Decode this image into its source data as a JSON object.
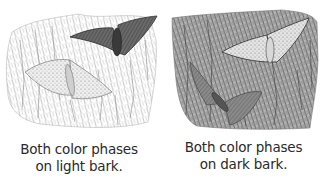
{
  "figure": {
    "panels": [
      {
        "id": "light-bark",
        "bark_shade": "light",
        "moths": [
          "dark-phase moth",
          "light-phase moth"
        ],
        "caption_line1": "Both color phases",
        "caption_line2": "on light bark."
      },
      {
        "id": "dark-bark",
        "bark_shade": "dark",
        "moths": [
          "light-phase moth",
          "dark-phase moth"
        ],
        "caption_line1": "Both color phases",
        "caption_line2": "on dark bark."
      }
    ],
    "colors": {
      "ink": "#2a2a2a",
      "light_bark": "#d8d8d8",
      "dark_bark": "#8a8a8a",
      "dark_moth": "#555555",
      "light_moth": "#c8c8c8"
    }
  }
}
